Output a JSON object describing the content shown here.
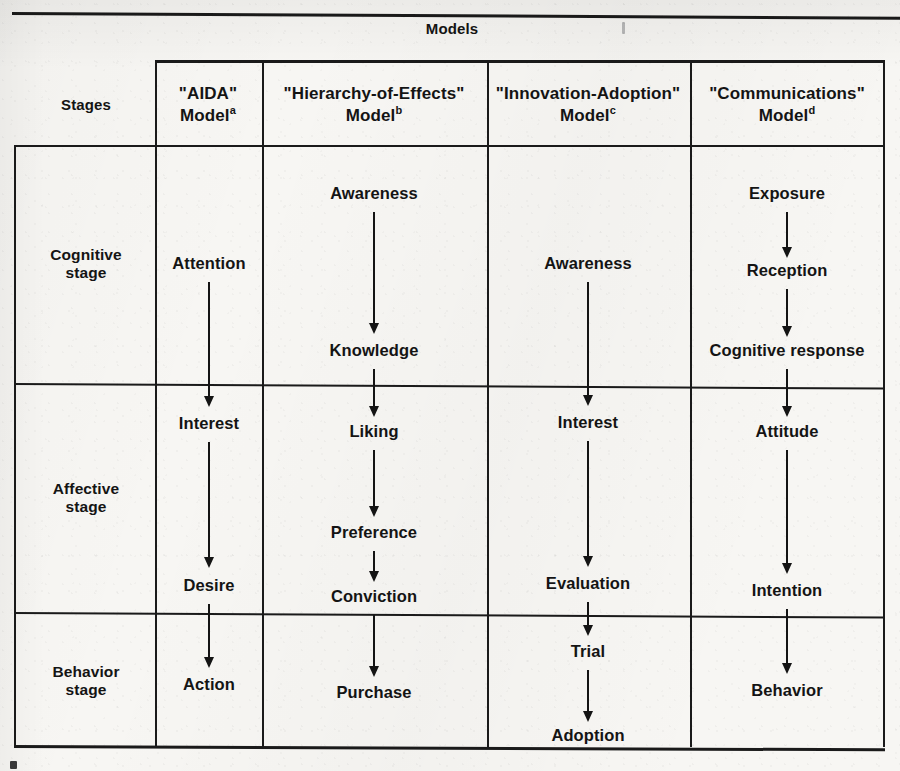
{
  "figure": {
    "models_header": "Models",
    "stages_header": "Stages"
  },
  "columns": [
    {
      "name_line1": "\"AIDA\"",
      "name_line2": "Model",
      "note": "a"
    },
    {
      "name_line1": "\"Hierarchy-of-Effects\"",
      "name_line2": "Model",
      "note": "b"
    },
    {
      "name_line1": "\"Innovation-Adoption\"",
      "name_line2": "Model",
      "note": "c"
    },
    {
      "name_line1": "\"Communications\"",
      "name_line2": "Model",
      "note": "d"
    }
  ],
  "stages": [
    {
      "line1": "Cognitive",
      "line2": "stage"
    },
    {
      "line1": "Affective",
      "line2": "stage"
    },
    {
      "line1": "Behavior",
      "line2": "stage"
    }
  ],
  "nodes": {
    "aida": [
      "Attention",
      "Interest",
      "Desire",
      "Action"
    ],
    "hierarchy_of_effects": [
      "Awareness",
      "Knowledge",
      "Liking",
      "Preference",
      "Conviction",
      "Purchase"
    ],
    "innovation_adoption": [
      "Awareness",
      "Interest",
      "Evaluation",
      "Trial",
      "Adoption"
    ],
    "communications": [
      "Exposure",
      "Reception",
      "Cognitive response",
      "Attitude",
      "Intention",
      "Behavior"
    ]
  },
  "colors": {
    "ink": "#141414",
    "paper": "#f7f6f3"
  }
}
